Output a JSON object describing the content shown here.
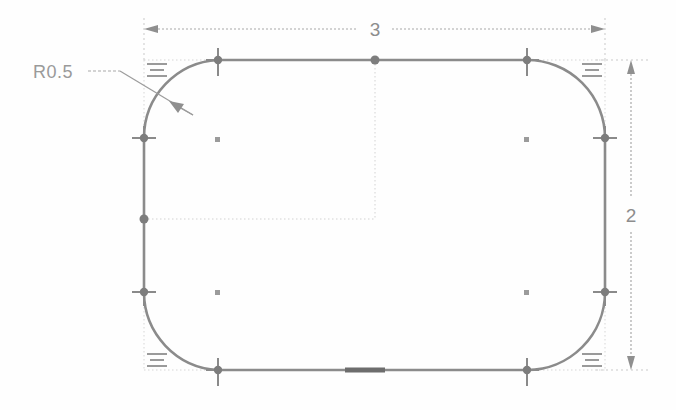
{
  "drawing": {
    "kind": "cad-sketch",
    "background_color": "#fefefe",
    "profile_color": "#8b8b8b",
    "construction_color": "#c9c9c9",
    "dimension_color": "#a0a0a0",
    "point_color": "#7d7d7d",
    "highlight_color": "#6a6a6a",
    "shape": "rounded-rectangle",
    "width_units": 3,
    "height_units": 2,
    "corner_radius_units": 0.5
  },
  "dimensions": {
    "width": {
      "value": "3",
      "orientation": "horizontal",
      "position": "top",
      "arrow_style": "double-filled"
    },
    "height": {
      "value": "2",
      "orientation": "vertical",
      "position": "right",
      "arrow_style": "double-filled"
    }
  },
  "annotations": {
    "radius_callout": {
      "text": "R0.5",
      "leader": "dashed-leader-with-arrow",
      "target": "top-left-fillet-arc"
    }
  },
  "constraints": [
    {
      "name": "equal-radius",
      "symbol": "=",
      "at": "top-left"
    },
    {
      "name": "equal-radius",
      "symbol": "=",
      "at": "top-right"
    },
    {
      "name": "equal-radius",
      "symbol": "=",
      "at": "bottom-left"
    },
    {
      "name": "equal-radius",
      "symbol": "=",
      "at": "bottom-right"
    }
  ],
  "points": {
    "tangent_vertices": 8,
    "arc_centers": 4,
    "midpoints": 2,
    "selected_segment": "bottom-edge-midsection"
  }
}
